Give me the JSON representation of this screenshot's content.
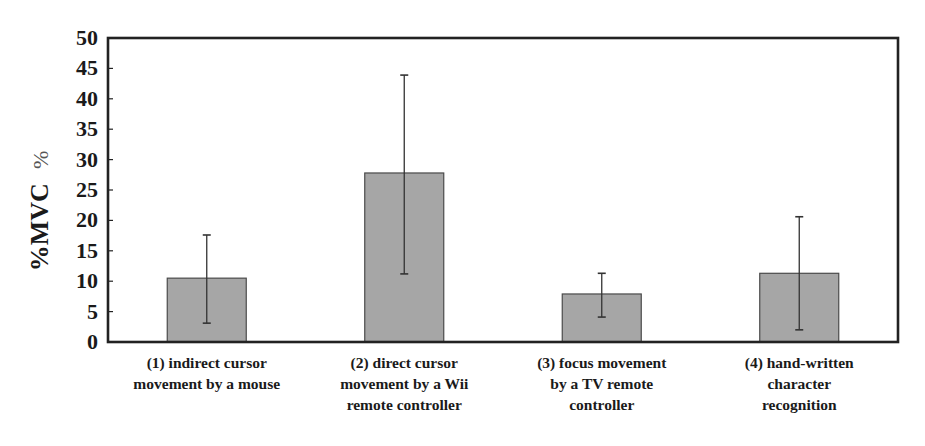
{
  "chart_data": {
    "type": "bar",
    "title": "",
    "xlabel": "",
    "ylabel": "%MVC",
    "ylabel_unit": "%",
    "ylim": [
      0,
      50
    ],
    "yticks": [
      0,
      5,
      10,
      15,
      20,
      25,
      30,
      35,
      40,
      45,
      50
    ],
    "grid": false,
    "legend": null,
    "categories": [
      "(1) indirect cursor movement by a mouse",
      "(2) direct cursor movement by a Wii remote controller",
      "(3) focus movement by a TV remote controller",
      "(4) hand-written character recognition"
    ],
    "category_lines": [
      [
        "(1) indirect cursor",
        "movement by a mouse"
      ],
      [
        "(2) direct cursor",
        "movement by a Wii",
        "remote controller"
      ],
      [
        "(3) focus movement",
        "by a TV remote",
        "controller"
      ],
      [
        "(4) hand-written",
        "character",
        "recognition"
      ]
    ],
    "values": [
      10.5,
      27.8,
      7.9,
      11.3
    ],
    "error_bars": [
      {
        "low": 3.1,
        "high": 17.6
      },
      {
        "low": 11.2,
        "high": 43.9
      },
      {
        "low": 4.1,
        "high": 11.3
      },
      {
        "low": 2.0,
        "high": 20.6
      }
    ],
    "colors": {
      "bar_fill": "#a6a6a6",
      "bar_stroke": "#4a4a4a",
      "axis": "#222222",
      "error": "#333333"
    }
  }
}
